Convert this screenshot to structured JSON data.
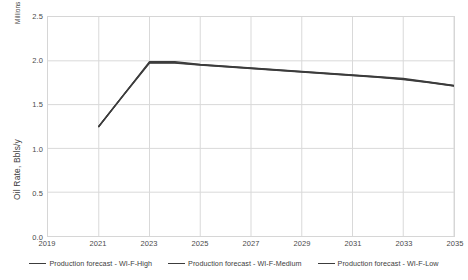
{
  "chart_data": {
    "type": "line",
    "title": "",
    "xlabel": "",
    "ylabel": "Oil Rate, Bbls/y",
    "y_unit_caption": "Millions",
    "xlim": [
      2019,
      2035
    ],
    "ylim": [
      0.0,
      2.5
    ],
    "grid": true,
    "legend_position": "bottom",
    "x_ticks": [
      "2019",
      "2021",
      "2023",
      "2025",
      "2027",
      "2029",
      "2031",
      "2033",
      "2035"
    ],
    "x_tick_values": [
      2019,
      2021,
      2023,
      2025,
      2027,
      2029,
      2031,
      2033,
      2035
    ],
    "y_ticks": [
      "0.0",
      "0.5",
      "1.0",
      "1.5",
      "2.0",
      "2.5"
    ],
    "y_tick_values": [
      0.0,
      0.5,
      1.0,
      1.5,
      2.0,
      2.5
    ],
    "x": [
      2021,
      2022,
      2023,
      2024,
      2025,
      2026,
      2027,
      2028,
      2029,
      2030,
      2031,
      2032,
      2033,
      2034,
      2035
    ],
    "series": [
      {
        "name": "Production forecast - WI-F-High",
        "color": "#3c3c3c",
        "values": [
          1.25,
          1.62,
          1.99,
          1.99,
          1.96,
          1.94,
          1.92,
          1.9,
          1.88,
          1.86,
          1.84,
          1.82,
          1.8,
          1.76,
          1.72
        ]
      },
      {
        "name": "Production forecast - WI-F-Medium",
        "color": "#3c3c3c",
        "values": [
          1.25,
          1.62,
          1.98,
          1.98,
          1.955,
          1.935,
          1.915,
          1.895,
          1.875,
          1.855,
          1.835,
          1.815,
          1.79,
          1.755,
          1.715
        ]
      },
      {
        "name": "Production forecast - WI-F-Low",
        "color": "#3c3c3c",
        "values": [
          1.25,
          1.615,
          1.975,
          1.975,
          1.95,
          1.93,
          1.91,
          1.89,
          1.87,
          1.85,
          1.83,
          1.81,
          1.785,
          1.75,
          1.71
        ]
      }
    ]
  },
  "legend": {
    "items": [
      {
        "label": "Production forecast - WI-F-High"
      },
      {
        "label": "Production forecast - WI-F-Medium"
      },
      {
        "label": "Production forecast - WI-F-Low"
      }
    ]
  }
}
